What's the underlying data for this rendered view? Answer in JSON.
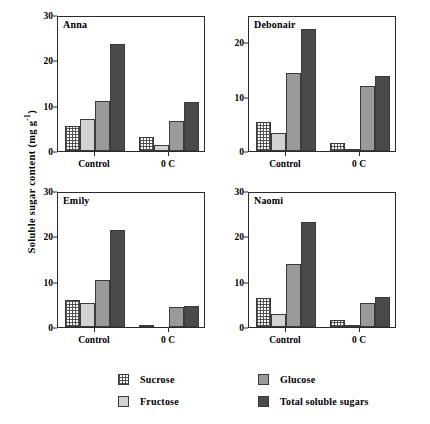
{
  "chart_data": {
    "type": "bar",
    "title": "",
    "xlabel": "",
    "ylabel": "Soluble sugar content (mg g-1)",
    "ylabel_base": "Soluble sugar content (mg g",
    "ylabel_sup": "-1",
    "ylabel_close": ")",
    "grid": false,
    "legend_position": "bottom",
    "categories": [
      "Control",
      "0 C"
    ],
    "series_names": [
      "Sucrose",
      "Fructose",
      "Glucose",
      "Total soluble sugars"
    ],
    "series_colors": [
      "#ffffff",
      "#d2d2d2",
      "#9a9a9a",
      "#4a4a4a"
    ],
    "panels": [
      {
        "name": "Anna",
        "ylim": [
          0,
          30
        ],
        "yticks": [
          0,
          10,
          20,
          30
        ],
        "ytick_labels": [
          "0",
          "10",
          "20",
          "30"
        ],
        "groups": [
          {
            "category": "Control",
            "values": [
              5.5,
              7.1,
              11.0,
              23.6
            ]
          },
          {
            "category": "0 C",
            "values": [
              3.0,
              1.3,
              6.6,
              10.8
            ]
          }
        ]
      },
      {
        "name": "Debonair",
        "ylim": [
          0,
          25
        ],
        "yticks": [
          0,
          10,
          20
        ],
        "ytick_labels": [
          "0",
          "10",
          "20"
        ],
        "groups": [
          {
            "category": "Control",
            "values": [
              5.4,
              3.4,
              14.3,
              22.5
            ]
          },
          {
            "category": "0 C",
            "values": [
              1.5,
              0.4,
              12.0,
              13.8
            ]
          }
        ]
      },
      {
        "name": "Emily",
        "ylim": [
          0,
          30
        ],
        "yticks": [
          0,
          10,
          20,
          30
        ],
        "ytick_labels": [
          "0",
          "10",
          "20",
          "30"
        ],
        "groups": [
          {
            "category": "Control",
            "values": [
              6.0,
              5.4,
              10.4,
              21.5
            ]
          },
          {
            "category": "0 C",
            "values": [
              0.2,
              0.0,
              4.5,
              4.7
            ]
          }
        ]
      },
      {
        "name": "Naomi",
        "ylim": [
          0,
          30
        ],
        "yticks": [
          0,
          10,
          20,
          30
        ],
        "ytick_labels": [
          "0",
          "10",
          "20",
          "30"
        ],
        "groups": [
          {
            "category": "Control",
            "values": [
              6.4,
              2.9,
              14.0,
              23.1
            ]
          },
          {
            "category": "0 C",
            "values": [
              1.6,
              0.2,
              5.2,
              6.7
            ]
          }
        ]
      }
    ]
  },
  "legend": {
    "items": [
      {
        "label": "Sucrose",
        "fill": "sucrose"
      },
      {
        "label": "Glucose",
        "fill": "glucose"
      },
      {
        "label": "Fructose",
        "fill": "fructose"
      },
      {
        "label": "Total soluble sugars",
        "fill": "total"
      }
    ]
  }
}
